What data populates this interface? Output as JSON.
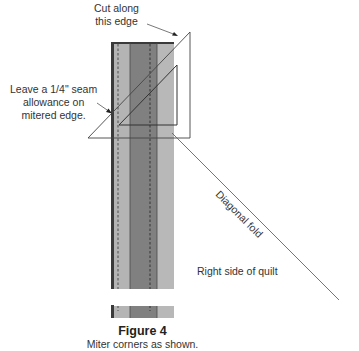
{
  "labels": {
    "cut_edge": "Cut along\nthis edge",
    "cut_edge_line1": "Cut along",
    "cut_edge_line2": "this edge",
    "seam_line1": "Leave a 1/4\" seam",
    "seam_line2": "allowance on",
    "seam_line3": "mitered edge.",
    "diagonal_fold": "Diagonal fold",
    "right_side": "Right side of quilt"
  },
  "caption": {
    "title": "Figure 4",
    "subtitle": "Miter corners as shown."
  },
  "colors": {
    "dark_border": "#3a3a3a",
    "light_strip": "#b4b4b4",
    "dark_strip": "#808080",
    "outline": "#555555",
    "line": "#666666"
  }
}
